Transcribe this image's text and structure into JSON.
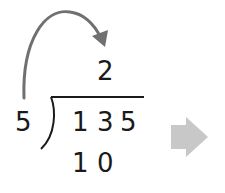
{
  "division": {
    "divisor": "5",
    "dividend": [
      "1",
      "3",
      "5"
    ],
    "quotient": "2",
    "partial_product": [
      "1",
      "0"
    ]
  },
  "annotations": {
    "curved_arrow": "divisor-to-quotient",
    "next_step_arrow": "right-arrow"
  },
  "colors": {
    "text": "#1a1a1a",
    "curved_arrow": "#707070",
    "next_arrow": "#c8c8c8"
  }
}
